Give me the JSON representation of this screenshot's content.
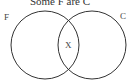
{
  "diagram": {
    "title": "Some F are C",
    "type": "venn",
    "sets": [
      {
        "label": "F",
        "cx": 45,
        "cy": 45,
        "r": 34
      },
      {
        "label": "C",
        "cx": 92,
        "cy": 45,
        "r": 34
      }
    ],
    "intersection_label": "X",
    "stroke_color": "#333333"
  }
}
